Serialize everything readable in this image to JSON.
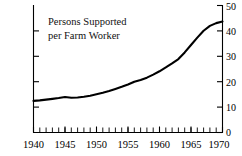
{
  "chart_data": {
    "type": "line",
    "title": "Persons Supported per Farm Worker",
    "title_lines": [
      "Persons Supported",
      "per Farm Worker"
    ],
    "xlabel": "",
    "ylabel": "",
    "xlim": [
      1940,
      1970
    ],
    "ylim": [
      0,
      50
    ],
    "y_axis_position": "right",
    "grid": false,
    "legend": null,
    "x_major_ticks": [
      1940,
      1945,
      1950,
      1955,
      1960,
      1965,
      1970
    ],
    "x_major_tick_labels": [
      "1940",
      "1945",
      "1950",
      "1955",
      "1960",
      "1965",
      "1970"
    ],
    "x_minor_tick_interval": 1,
    "y_ticks": [
      0,
      10,
      20,
      30,
      40,
      50
    ],
    "y_tick_labels": [
      "0",
      "10",
      "20",
      "30",
      "40",
      "50"
    ],
    "line_color": "#000000",
    "series": [
      {
        "name": "Persons Supported per Farm Worker",
        "x": [
          1940,
          1941,
          1942,
          1943,
          1944,
          1945,
          1946,
          1947,
          1948,
          1949,
          1950,
          1951,
          1952,
          1953,
          1954,
          1955,
          1956,
          1957,
          1958,
          1959,
          1960,
          1961,
          1962,
          1963,
          1964,
          1965,
          1966,
          1967,
          1968,
          1969,
          1970
        ],
        "values": [
          12.4,
          12.6,
          12.9,
          13.2,
          13.5,
          13.9,
          13.6,
          13.7,
          14.0,
          14.4,
          15.0,
          15.6,
          16.3,
          17.1,
          17.9,
          18.8,
          19.9,
          20.6,
          21.5,
          22.7,
          24.0,
          25.5,
          27.1,
          28.8,
          31.4,
          34.3,
          37.2,
          39.9,
          41.8,
          42.9,
          43.5
        ]
      }
    ]
  },
  "axes": {
    "title_line_1": "Persons Supported",
    "title_line_2": "per Farm Worker"
  }
}
